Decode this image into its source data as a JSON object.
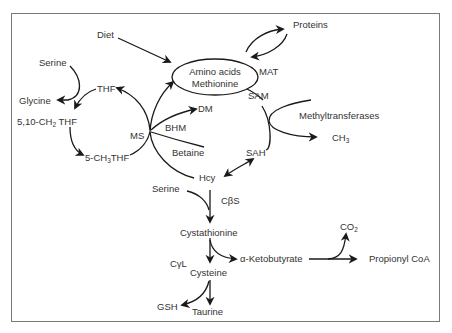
{
  "diagram": {
    "border_color": "#7a7a7a",
    "line_color": "#1a1a1a",
    "text_color": "#333333",
    "nodes": {
      "diet": "Diet",
      "proteins": "Proteins",
      "amino_acids_line1": "Amino acids",
      "amino_acids_line2": "Methionine",
      "mat": "MAT",
      "sam": "SAM",
      "methyltransferases": "Methyltransferases",
      "ch3_base": "CH",
      "ch3_sub": "3",
      "sah": "SAH",
      "hcy": "Hcy",
      "serine_top": "Serine",
      "glycine": "Glycine",
      "thf": "THF",
      "methylene_thf_pre": "5,10-CH",
      "methylene_thf_sub": "2",
      "methylene_thf_post": " THF",
      "methyl_thf_pre": "5-CH",
      "methyl_thf_sub": "3",
      "methyl_thf_post": "THF",
      "ms": "MS",
      "dm": "DM",
      "bhm": "BHM",
      "betaine": "Betaine",
      "serine_bottom": "Serine",
      "cbs": "CβS",
      "cystathionine": "Cystathionine",
      "cgl": "CγL",
      "cysteine": "Cysteine",
      "alpha_ketobutyrate": "α-Ketobutyrate",
      "co2_base": "CO",
      "co2_sub": "2",
      "propionyl_coa": "Propionyl CoA",
      "gsh": "GSH",
      "taurine": "Taurine"
    }
  }
}
